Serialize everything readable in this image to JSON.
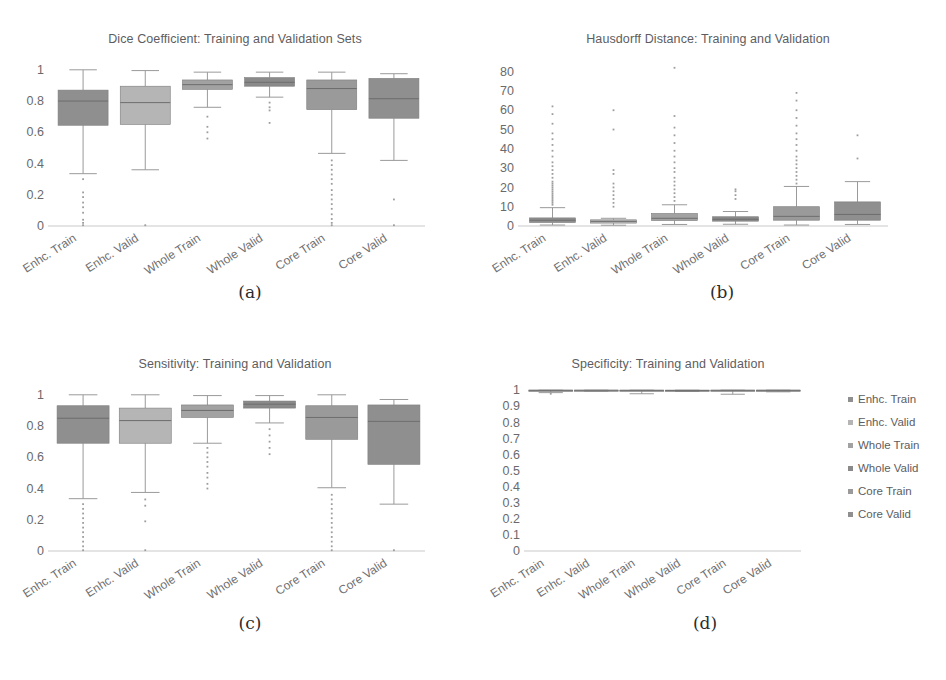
{
  "figure": {
    "background": "#ffffff",
    "text_color": "#5d5d5f",
    "box_fill_dark": "#8f8f8f",
    "box_fill_light": "#b5b5b5",
    "line_color": "#9a9a9a",
    "axis_color": "#c9c9c9",
    "watermark": ""
  },
  "captions": {
    "a": "(a)",
    "b": "(b)",
    "c": "(c)",
    "d": "(d)"
  },
  "categories": [
    "Enhc. Train",
    "Enhc. Valid",
    "Whole Train",
    "Whole Valid",
    "Core Train",
    "Core Valid"
  ],
  "legend": {
    "position": "right",
    "items": [
      {
        "label": "Enhc. Train",
        "color": "#8f8f8f"
      },
      {
        "label": "Enhc. Valid",
        "color": "#b5b5b5"
      },
      {
        "label": "Whole Train",
        "color": "#a2a2a2"
      },
      {
        "label": "Whole Valid",
        "color": "#8a8a8a"
      },
      {
        "label": "Core Train",
        "color": "#9a9a9a"
      },
      {
        "label": "Core Valid",
        "color": "#8f8f8f"
      }
    ]
  },
  "chart_data": [
    {
      "id": "dice",
      "panel": "a",
      "type": "box",
      "title": "Dice Coefficient: Training and Validation Sets",
      "xlabel": "",
      "ylabel": "",
      "ylim": [
        0,
        1.05
      ],
      "yticks": [
        0,
        0.2,
        0.4,
        0.6,
        0.8,
        1
      ],
      "ytick_labels": [
        "0",
        "0.2",
        "0.4",
        "0.6",
        "0.8",
        "1"
      ],
      "grid": false,
      "categories": [
        "Enhc. Train",
        "Enhc. Valid",
        "Whole Train",
        "Whole Valid",
        "Core Train",
        "Core Valid"
      ],
      "boxes": [
        {
          "name": "Enhc. Train",
          "fill": "#8f8f8f",
          "whisker_low": 0.335,
          "q1": 0.645,
          "median": 0.8,
          "q3": 0.87,
          "whisker_high": 1.0,
          "outliers": [
            0.3,
            0.215,
            0.185,
            0.15,
            0.12,
            0.085,
            0.04,
            0.02,
            0.005
          ]
        },
        {
          "name": "Enhc. Valid",
          "fill": "#b5b5b5",
          "whisker_low": 0.36,
          "q1": 0.65,
          "median": 0.79,
          "q3": 0.895,
          "whisker_high": 0.995,
          "outliers": [
            0.005
          ]
        },
        {
          "name": "Whole Train",
          "fill": "#a2a2a2",
          "whisker_low": 0.76,
          "q1": 0.875,
          "median": 0.905,
          "q3": 0.935,
          "whisker_high": 0.985,
          "outliers": [
            0.7,
            0.635,
            0.6,
            0.56
          ]
        },
        {
          "name": "Whole Valid",
          "fill": "#8a8a8a",
          "whisker_low": 0.825,
          "q1": 0.895,
          "median": 0.92,
          "q3": 0.95,
          "whisker_high": 0.985,
          "outliers": [
            0.79,
            0.76,
            0.74,
            0.66
          ]
        },
        {
          "name": "Core Train",
          "fill": "#9a9a9a",
          "whisker_low": 0.465,
          "q1": 0.745,
          "median": 0.88,
          "q3": 0.935,
          "whisker_high": 0.985,
          "outliers": [
            0.42,
            0.39,
            0.36,
            0.33,
            0.3,
            0.27,
            0.23,
            0.2,
            0.17,
            0.14,
            0.11,
            0.075,
            0.045,
            0.02,
            0.005
          ]
        },
        {
          "name": "Core Valid",
          "fill": "#8f8f8f",
          "whisker_low": 0.42,
          "q1": 0.69,
          "median": 0.815,
          "q3": 0.945,
          "whisker_high": 0.975,
          "outliers": [
            0.17,
            0.005
          ]
        }
      ]
    },
    {
      "id": "hausdorff",
      "panel": "b",
      "type": "box",
      "title": "Hausdorff Distance: Training and Validation",
      "xlabel": "",
      "ylabel": "",
      "ylim": [
        0,
        85
      ],
      "yticks": [
        0,
        10,
        20,
        30,
        40,
        50,
        60,
        70,
        80
      ],
      "ytick_labels": [
        "0",
        "10",
        "20",
        "30",
        "40",
        "50",
        "60",
        "70",
        "80"
      ],
      "grid": false,
      "categories": [
        "Enhc. Train",
        "Enhc. Valid",
        "Whole Train",
        "Whole Valid",
        "Core Train",
        "Core Valid"
      ],
      "boxes": [
        {
          "name": "Enhc. Train",
          "fill": "#8f8f8f",
          "whisker_low": 0.5,
          "q1": 1.8,
          "median": 3.0,
          "q3": 4.2,
          "whisker_high": 9.5,
          "outliers": [
            11,
            12,
            13,
            14,
            15,
            16,
            17,
            18,
            19,
            20,
            21,
            22,
            23,
            25,
            27,
            29,
            31,
            33,
            36,
            39,
            42,
            45,
            48,
            53,
            58,
            62
          ]
        },
        {
          "name": "Enhc. Valid",
          "fill": "#b5b5b5",
          "whisker_low": 0.4,
          "q1": 1.5,
          "median": 2.4,
          "q3": 3.2,
          "whisker_high": 4.0,
          "outliers": [
            10,
            12,
            14,
            16,
            18,
            20,
            22,
            27,
            29,
            50,
            60
          ]
        },
        {
          "name": "Whole Train",
          "fill": "#a2a2a2",
          "whisker_low": 0.8,
          "q1": 2.8,
          "median": 4.0,
          "q3": 6.5,
          "whisker_high": 11.0,
          "outliers": [
            13,
            15,
            17,
            19,
            21,
            23,
            25,
            28,
            30,
            33,
            36,
            39,
            43,
            47,
            51,
            57,
            82
          ]
        },
        {
          "name": "Whole Valid",
          "fill": "#8a8a8a",
          "whisker_low": 0.9,
          "q1": 2.5,
          "median": 3.5,
          "q3": 4.8,
          "whisker_high": 7.5,
          "outliers": [
            14,
            16,
            18,
            19
          ]
        },
        {
          "name": "Core Train",
          "fill": "#9a9a9a",
          "whisker_low": 0.5,
          "q1": 3.0,
          "median": 5.0,
          "q3": 10.0,
          "whisker_high": 20.5,
          "outliers": [
            22,
            24,
            26,
            28,
            30,
            32,
            34,
            36,
            39,
            42,
            45,
            48,
            52,
            56,
            60,
            65,
            69
          ]
        },
        {
          "name": "Core Valid",
          "fill": "#8f8f8f",
          "whisker_low": 0.8,
          "q1": 3.0,
          "median": 6.0,
          "q3": 12.5,
          "whisker_high": 23.0,
          "outliers": [
            35,
            47
          ]
        }
      ]
    },
    {
      "id": "sensitivity",
      "panel": "c",
      "type": "box",
      "title": "Sensitivity: Training and Validation",
      "xlabel": "",
      "ylabel": "",
      "ylim": [
        0,
        1.05
      ],
      "yticks": [
        0,
        0.2,
        0.4,
        0.6,
        0.8,
        1
      ],
      "ytick_labels": [
        "0",
        "0.2",
        "0.4",
        "0.6",
        "0.8",
        "1"
      ],
      "grid": false,
      "categories": [
        "Enhc. Train",
        "Enhc. Valid",
        "Whole Train",
        "Whole Valid",
        "Core Train",
        "Core Valid"
      ],
      "boxes": [
        {
          "name": "Enhc. Train",
          "fill": "#8f8f8f",
          "whisker_low": 0.335,
          "q1": 0.69,
          "median": 0.85,
          "q3": 0.93,
          "whisker_high": 1.0,
          "outliers": [
            0.3,
            0.27,
            0.24,
            0.21,
            0.18,
            0.15,
            0.12,
            0.09,
            0.06,
            0.03,
            0.005
          ]
        },
        {
          "name": "Enhc. Valid",
          "fill": "#b5b5b5",
          "whisker_low": 0.375,
          "q1": 0.69,
          "median": 0.835,
          "q3": 0.915,
          "whisker_high": 1.0,
          "outliers": [
            0.33,
            0.29,
            0.19,
            0.005
          ]
        },
        {
          "name": "Whole Train",
          "fill": "#a2a2a2",
          "whisker_low": 0.69,
          "q1": 0.855,
          "median": 0.9,
          "q3": 0.935,
          "whisker_high": 0.995,
          "outliers": [
            0.66,
            0.63,
            0.6,
            0.57,
            0.54,
            0.5,
            0.47,
            0.43,
            0.4
          ]
        },
        {
          "name": "Whole Valid",
          "fill": "#8a8a8a",
          "whisker_low": 0.82,
          "q1": 0.915,
          "median": 0.94,
          "q3": 0.96,
          "whisker_high": 0.995,
          "outliers": [
            0.78,
            0.74,
            0.7,
            0.66,
            0.62
          ]
        },
        {
          "name": "Core Train",
          "fill": "#9a9a9a",
          "whisker_low": 0.405,
          "q1": 0.715,
          "median": 0.855,
          "q3": 0.93,
          "whisker_high": 1.0,
          "outliers": [
            0.36,
            0.33,
            0.3,
            0.27,
            0.24,
            0.21,
            0.18,
            0.15,
            0.12,
            0.09,
            0.06,
            0.03,
            0.005
          ]
        },
        {
          "name": "Core Valid",
          "fill": "#8f8f8f",
          "whisker_low": 0.3,
          "q1": 0.555,
          "median": 0.83,
          "q3": 0.935,
          "whisker_high": 0.97,
          "outliers": [
            0.005
          ]
        }
      ]
    },
    {
      "id": "specificity",
      "panel": "d",
      "type": "box",
      "title": "Specificity: Training and Validation",
      "xlabel": "",
      "ylabel": "",
      "ylim": [
        0,
        1.02
      ],
      "yticks": [
        0,
        0.1,
        0.2,
        0.3,
        0.4,
        0.5,
        0.6,
        0.7,
        0.8,
        0.9,
        1
      ],
      "ytick_labels": [
        "0",
        "0.1",
        "0.2",
        "0.3",
        "0.4",
        "0.5",
        "0.6",
        "0.7",
        "0.8",
        "0.9",
        "1"
      ],
      "grid": false,
      "categories": [
        "Enhc. Train",
        "Enhc. Valid",
        "Whole Train",
        "Whole Valid",
        "Core Train",
        "Core Valid"
      ],
      "boxes": [
        {
          "name": "Enhc. Train",
          "fill": "#8f8f8f",
          "whisker_low": 0.985,
          "q1": 0.9995,
          "median": 0.9999,
          "q3": 1.0,
          "whisker_high": 1.0,
          "outliers": [
            0.978
          ]
        },
        {
          "name": "Enhc. Valid",
          "fill": "#b5b5b5",
          "whisker_low": 0.993,
          "q1": 0.9996,
          "median": 0.9999,
          "q3": 1.0,
          "whisker_high": 1.0,
          "outliers": []
        },
        {
          "name": "Whole Train",
          "fill": "#a2a2a2",
          "whisker_low": 0.978,
          "q1": 0.999,
          "median": 0.9996,
          "q3": 0.9999,
          "whisker_high": 1.0,
          "outliers": []
        },
        {
          "name": "Whole Valid",
          "fill": "#8a8a8a",
          "whisker_low": 0.992,
          "q1": 0.9985,
          "median": 0.9993,
          "q3": 0.9998,
          "whisker_high": 1.0,
          "outliers": []
        },
        {
          "name": "Core Train",
          "fill": "#9a9a9a",
          "whisker_low": 0.975,
          "q1": 0.9992,
          "median": 0.9997,
          "q3": 1.0,
          "whisker_high": 1.0,
          "outliers": []
        },
        {
          "name": "Core Valid",
          "fill": "#8f8f8f",
          "whisker_low": 0.99,
          "q1": 0.9995,
          "median": 0.9998,
          "q3": 1.0,
          "whisker_high": 1.0,
          "outliers": []
        }
      ]
    }
  ]
}
